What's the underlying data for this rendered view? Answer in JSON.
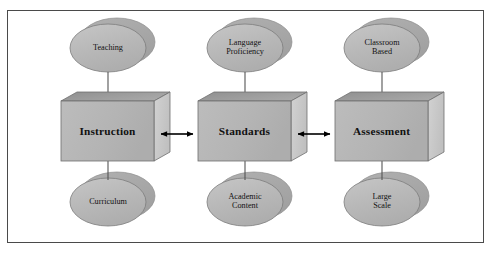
{
  "figure": {
    "type": "relationship-diagram",
    "border_color": "#4a4a4a",
    "background": "#ffffff"
  },
  "palette": {
    "ellipse_front": "#b9b9b9",
    "ellipse_shadow": "#a6a6a6",
    "cube_front": "#b5b5b5",
    "cube_top": "#9a9a9a",
    "cube_side": "#c9c9c9",
    "outline": "#6e6e6e",
    "connector": "#555555",
    "arrow": "#000000",
    "text": "#111111"
  },
  "columns": [
    {
      "id": "instruction",
      "top_node": {
        "name": "top-node-teaching",
        "label": "Teaching"
      },
      "center_node": {
        "name": "cube-instruction",
        "label": "Instruction"
      },
      "bottom_node": {
        "name": "bottom-node-curriculum",
        "label": "Curriculum"
      }
    },
    {
      "id": "standards",
      "top_node": {
        "name": "top-node-language-proficiency",
        "label": "Language\nProficiency"
      },
      "center_node": {
        "name": "cube-standards",
        "label": "Standards"
      },
      "bottom_node": {
        "name": "bottom-node-academic-content",
        "label": "Academic\nContent"
      }
    },
    {
      "id": "assessment",
      "top_node": {
        "name": "top-node-classroom-based",
        "label": "Classroom\nBased"
      },
      "center_node": {
        "name": "cube-assessment",
        "label": "Assessment"
      },
      "bottom_node": {
        "name": "bottom-node-large-scale",
        "label": "Large\nScale"
      }
    }
  ],
  "connectors": [
    {
      "name": "arrow-instruction-standards",
      "style": "double-headed",
      "from": "instruction",
      "to": "standards"
    },
    {
      "name": "arrow-standards-assessment",
      "style": "double-headed",
      "from": "standards",
      "to": "assessment"
    }
  ],
  "stems": [
    {
      "name": "stem-teaching-instruction"
    },
    {
      "name": "stem-instruction-curriculum"
    },
    {
      "name": "stem-language-standards"
    },
    {
      "name": "stem-standards-academic"
    },
    {
      "name": "stem-classroom-assessment"
    },
    {
      "name": "stem-assessment-large-scale"
    }
  ]
}
